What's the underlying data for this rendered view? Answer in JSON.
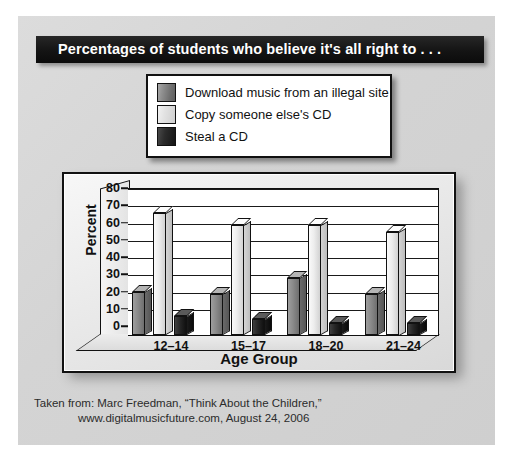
{
  "title": "Percentages of students who believe it's all right to . . .",
  "legend": {
    "items": [
      {
        "label": "Download music from an illegal site",
        "swatch": "dark-gray",
        "color": "#8a8a8a"
      },
      {
        "label": "Copy someone else's CD",
        "swatch": "light-gray",
        "color": "#e6e6e6"
      },
      {
        "label": "Steal a CD",
        "swatch": "black",
        "color": "#1a1a1a"
      }
    ]
  },
  "caption": {
    "line1": "Taken from: Marc Freedman, “Think About the Children,”",
    "line2": "www.digitalmusicfuture.com, August 24, 2006"
  },
  "chart_data": {
    "type": "bar",
    "title": "Percentages of students who believe it's all right to . . .",
    "xlabel": "Age Group",
    "ylabel": "Percent",
    "categories": [
      "12–14",
      "15–17",
      "18–20",
      "21–24"
    ],
    "yticks": [
      0,
      10,
      20,
      30,
      40,
      50,
      60,
      70,
      80
    ],
    "ylim": [
      0,
      80
    ],
    "grid": true,
    "legend_position": "above-plot",
    "series": [
      {
        "name": "Download music from an illegal site",
        "color": "#8a8a8a",
        "values": [
          25,
          24,
          33,
          24
        ]
      },
      {
        "name": "Copy someone else's CD",
        "color": "#e6e6e6",
        "values": [
          71,
          64,
          64,
          60
        ]
      },
      {
        "name": "Steal a CD",
        "color": "#1a1a1a",
        "values": [
          11,
          9,
          7,
          7
        ]
      }
    ]
  }
}
